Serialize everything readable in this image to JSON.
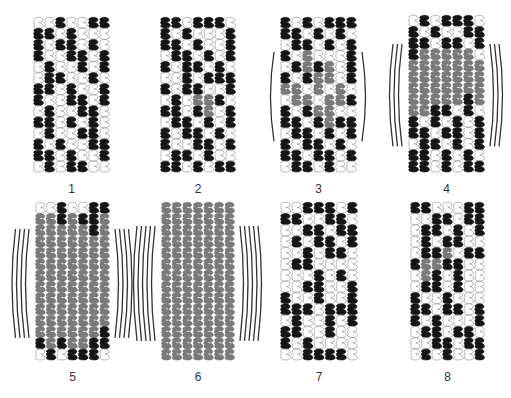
{
  "figure": {
    "colors": {
      "black": "#151515",
      "gray": "#7a7a7a",
      "white_fill": "#ffffff",
      "outline": "#8a8a8a",
      "arc": "#333333"
    },
    "legend_key": {
      "B": "black unit",
      "G": "gray unit",
      "W": "white (outline) unit"
    },
    "panels": [
      {
        "id": "1",
        "label": "1",
        "x": 33,
        "y": 17,
        "w": 77,
        "h": 155,
        "arcs": 0,
        "rows": [
          "WWBWWBB",
          "BBWBWWW",
          "BWBBWBW",
          "BWWBBWB",
          "WBWWBWB",
          "WBBWWBW",
          "BBWBWWB",
          "BWWBBWB",
          "WBWWBBW",
          "BBWBWBW",
          "WBWWBBW",
          "BWBWWBB",
          "BBWBWWB",
          "WBWBBWW"
        ]
      },
      {
        "id": "2",
        "label": "2",
        "x": 160,
        "y": 17,
        "w": 76,
        "h": 155,
        "arcs": 0,
        "rows": [
          "BBWBBBW",
          "BWBWWWB",
          "BBWBWWB",
          "WBBWBWB",
          "BWBBWBW",
          "WWBWBBB",
          "BWBBWWB",
          "WBWGGBW",
          "BBWBGWB",
          "WBBWBWB",
          "BWBBWBW",
          "BWWBBWB",
          "WBBWBWW",
          "BBWBWBB"
        ]
      },
      {
        "id": "3",
        "label": "3",
        "x": 280,
        "y": 17,
        "w": 77,
        "h": 155,
        "arcs": 1,
        "rows": [
          "BWBWBBB",
          "BBWBWBW",
          "WBBWBWB",
          "BWGWWWB",
          "WBGBGWB",
          "BWBGGWB",
          "GGWGWGW",
          "WGGWGGB",
          "BWBGGWW",
          "BBWBGBB",
          "WBBWBWB",
          "BWBBWBW",
          "BBWBBWB",
          "WBBWBWW"
        ]
      },
      {
        "id": "4",
        "label": "4",
        "x": 408,
        "y": 15,
        "w": 77,
        "h": 157,
        "arcs": 3,
        "rows": [
          "WBWBBBW",
          "BWBWWBB",
          "BBWBBWB",
          "BGGGGGW",
          "GGGGGGG",
          "GGGGGGG",
          "GGGGGGG",
          "GGGGGBG",
          "GGBBWBW",
          "BWBWBWB",
          "BBWBBWB",
          "WBBWBWB",
          "BBWBWBW",
          "BBWBWBB"
        ]
      },
      {
        "id": "5",
        "label": "5",
        "x": 35,
        "y": 202,
        "w": 75,
        "h": 158,
        "arcs": 4,
        "rows": [
          "WWBWWBB",
          "GGBGBBG",
          "GGGGGBG",
          "GGGGGGG",
          "GGGGGGG",
          "GGGGGGG",
          "GGGGGGG",
          "GGGGGGG",
          "GGGGGGG",
          "GGGGGGG",
          "GGGGGGG",
          "GGGGGGB",
          "BGBGGBB",
          "WBWBBBW"
        ]
      },
      {
        "id": "6",
        "label": "6",
        "x": 161,
        "y": 202,
        "w": 74,
        "h": 158,
        "arcs": 5,
        "rows": [
          "GGGGGGG",
          "GGGGGGG",
          "GGGGGGG",
          "GGGGGGG",
          "GGGGGGG",
          "GGGGGGG",
          "GGGGGGG",
          "GGGGGGG",
          "GGGGGGG",
          "GGGGGGG",
          "GGGGGGG",
          "GGGGGGG",
          "GGGGGGG",
          "GGGGGGG"
        ]
      },
      {
        "id": "7",
        "label": "7",
        "x": 280,
        "y": 202,
        "w": 78,
        "h": 158,
        "arcs": 0,
        "rows": [
          "WWBBBWB",
          "BBWWBBW",
          "WWBBWBB",
          "WBWBBWB",
          "WWBWBBW",
          "WBBWWWW",
          "WWWBWBW",
          "WWBBWWB",
          "BWWBWWB",
          "BBBWBBB",
          "WBWWBWB",
          "BBWWBWW",
          "BWBWWWW",
          "WWBBBBW"
        ]
      },
      {
        "id": "8",
        "label": "8",
        "x": 410,
        "y": 202,
        "w": 75,
        "h": 158,
        "arcs": 0,
        "rows": [
          "BBWWWBB",
          "WWBBWBB",
          "WBBWBWB",
          "WBWBBWW",
          "WBBGWBB",
          "BGGBBWW",
          "WGBWBWW",
          "WBBWBWW",
          "BWWBWWW",
          "BBWBBWB",
          "BWBWWWB",
          "WBBWBBW",
          "WWBBWBB",
          "WBWBWWB"
        ]
      }
    ]
  }
}
